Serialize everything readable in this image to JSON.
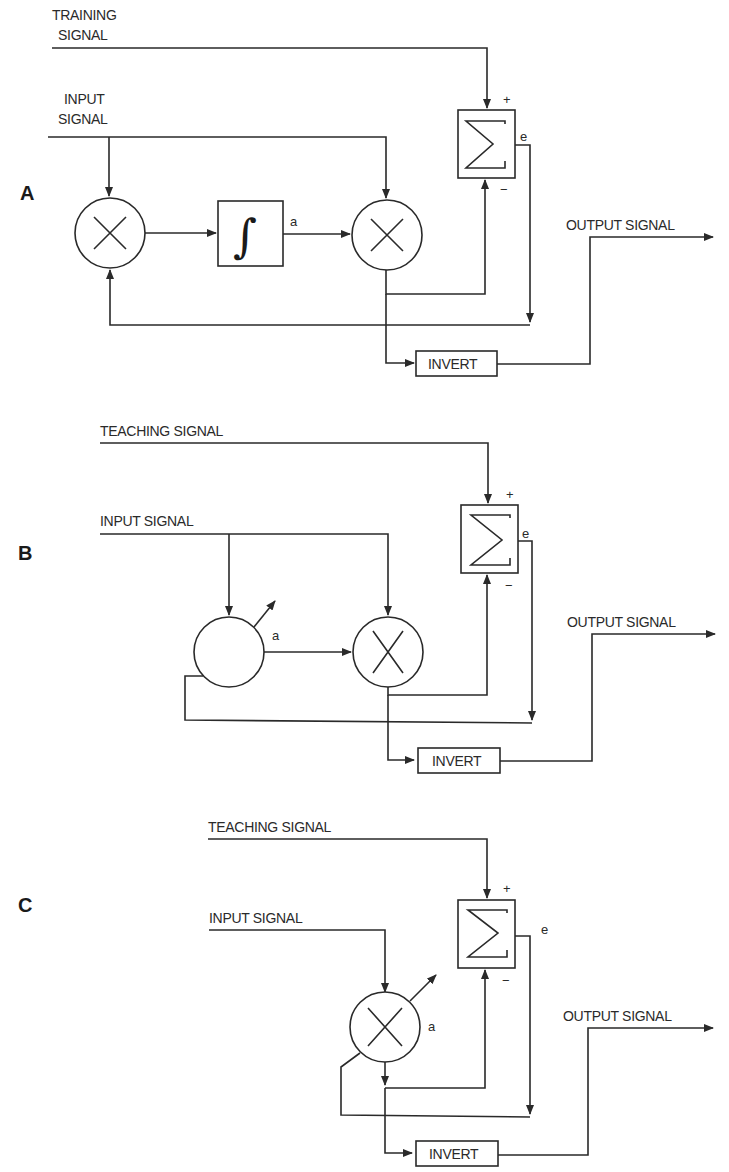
{
  "figure": {
    "panels": [
      {
        "id": "A",
        "label": "A",
        "training_label_line1": "TRAINING",
        "training_label_line2": "SIGNAL",
        "input_label_line1": "INPUT",
        "input_label_line2": "SIGNAL",
        "output_label": "OUTPUT SIGNAL",
        "invert_label": "INVERT",
        "weight_label": "a",
        "error_label": "e",
        "plus_label": "+",
        "minus_label": "−",
        "sum_symbol": "Σ",
        "integrator_symbol": "∫"
      },
      {
        "id": "B",
        "label": "B",
        "teaching_label": "TEACHING SIGNAL",
        "input_label": "INPUT SIGNAL",
        "output_label": "OUTPUT SIGNAL",
        "invert_label": "INVERT",
        "weight_label": "a",
        "error_label": "e",
        "plus_label": "+",
        "minus_label": "−"
      },
      {
        "id": "C",
        "label": "C",
        "teaching_label": "TEACHING SIGNAL",
        "input_label": "INPUT SIGNAL",
        "output_label": "OUTPUT SIGNAL",
        "invert_label": "INVERT",
        "weight_label": "a",
        "error_label": "e",
        "plus_label": "+",
        "minus_label": "−"
      }
    ]
  }
}
